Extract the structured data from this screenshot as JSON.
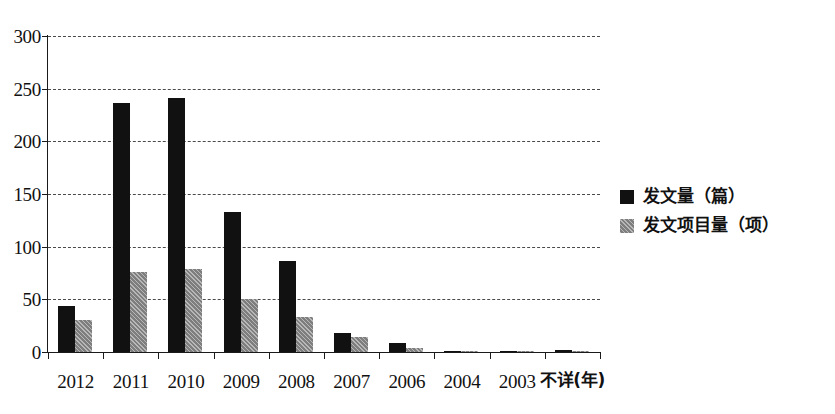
{
  "chart_data": {
    "type": "bar",
    "title": "",
    "subtitle": "",
    "xlabel": "年",
    "ylabel": "",
    "ylim": [
      0,
      300
    ],
    "yticks": [
      0,
      50,
      100,
      150,
      200,
      250,
      300
    ],
    "ytick_labels": [
      "0",
      "50",
      "100",
      "150",
      "200",
      "250",
      "300"
    ],
    "grid": true,
    "grid_axis": "y",
    "grid_style": "dashed",
    "legend_position": "right",
    "categories": [
      "2012",
      "2011",
      "2010",
      "2009",
      "2008",
      "2007",
      "2006",
      "2004",
      "2003",
      "不详(年)"
    ],
    "series": [
      {
        "name": "发文量（篇）",
        "color": "#111111",
        "values": [
          44,
          236,
          241,
          133,
          86,
          18,
          9,
          1,
          1,
          2
        ]
      },
      {
        "name": "发文项目量（项）",
        "color": "#8c8c8c",
        "values": [
          30,
          76,
          79,
          50,
          33,
          14,
          4,
          1,
          1,
          1
        ]
      }
    ]
  },
  "legend": {
    "entries": [
      {
        "label": "发文量（篇）"
      },
      {
        "label": "发文项目量（项）"
      }
    ]
  }
}
